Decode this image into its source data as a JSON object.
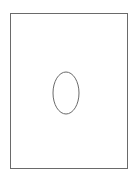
{
  "diagram": {
    "frame": {
      "stroke": "#6a6a6a",
      "fill": "#ffffff"
    },
    "ellipse": {
      "cx": 66,
      "cy": 93,
      "rx": 13,
      "ry": 21,
      "stroke": "#6a6a6a",
      "fill": "none"
    }
  }
}
